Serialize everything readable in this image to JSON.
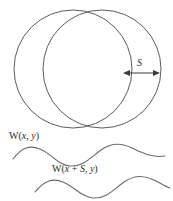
{
  "figure": {
    "name": "shearing-interferometer-wavefront-diagram",
    "shear_label": "S",
    "wavefront_label_1": "W(x, y)",
    "wavefront_label_2": "W(x + S, y)",
    "wavefront_1_parts": {
      "function": "W",
      "open_paren": "(",
      "arg_x": "x",
      "comma": ", ",
      "arg_y": "y",
      "close_paren": ")"
    },
    "wavefront_2_parts": {
      "function": "W",
      "open_paren": "(",
      "arg_x": "x",
      "plus": " + ",
      "arg_s": "S",
      "comma": ", ",
      "arg_y": "y",
      "close_paren": ")"
    },
    "colors": {
      "circle_stroke": "#4a4a4a",
      "wave_stroke": "#6b6b6b",
      "dimension_stroke": "#3a3a3a",
      "background": "#ffffff",
      "text": "#2b2b2b"
    },
    "shapes": {
      "circle_left": {
        "cx": 73,
        "cy": 69,
        "r": 59
      },
      "circle_right": {
        "cx": 102,
        "cy": 69,
        "r": 59
      },
      "dimension_arrow": {
        "x1": 124,
        "x2": 159,
        "y": 73
      }
    }
  }
}
